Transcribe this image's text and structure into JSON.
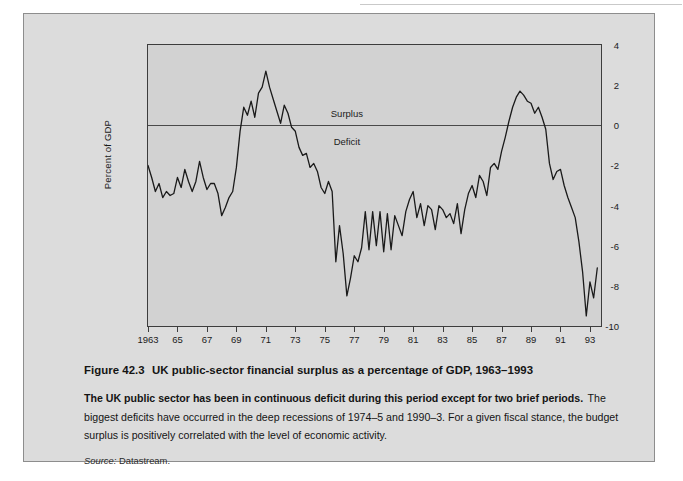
{
  "figure": {
    "number": "Figure 42.3",
    "title": "UK public-sector financial surplus as a percentage of GDP, 1963–1993",
    "lead": "The UK public sector has been in continuous deficit during this period except for two brief periods.",
    "body": "The biggest deficits have occurred in the deep recessions of 1974–5 and 1990–3. For a given fiscal stance, the budget surplus is positively correlated with the level of economic activity.",
    "source_label": "Source:",
    "source_value": "Datastream."
  },
  "colors": {
    "page_background": "#ffffff",
    "figure_background": "#dcdcdc",
    "plot_background": "#d2d2d2",
    "axis": "#3d3d3d",
    "line": "#1a1a1a",
    "text": "#141414"
  },
  "chart_data": {
    "type": "line",
    "title": "UK public-sector financial surplus as a percentage of GDP, 1963–1993",
    "xlabel": "",
    "ylabel": "Percent of GDP",
    "ylim": [
      -10,
      4
    ],
    "xlim": [
      1963,
      1993.75
    ],
    "yticks": [
      4,
      2,
      0,
      -2,
      -4,
      -6,
      -8,
      -10
    ],
    "ytick_labels": [
      "4",
      "2",
      "0",
      "-2",
      "-4",
      "-6",
      "-8",
      "-10"
    ],
    "xticks": [
      1963,
      1965,
      1967,
      1969,
      1971,
      1973,
      1975,
      1977,
      1979,
      1981,
      1983,
      1985,
      1987,
      1989,
      1991,
      1993
    ],
    "xtick_labels": [
      "1963",
      "65",
      "67",
      "69",
      "71",
      "73",
      "75",
      "77",
      "79",
      "81",
      "83",
      "85",
      "87",
      "89",
      "91",
      "93"
    ],
    "grid": false,
    "legend": "none",
    "annotations": [
      {
        "text": "Surplus",
        "x": 1976.5,
        "y": 0.55
      },
      {
        "text": "Deficit",
        "x": 1976.5,
        "y": -0.85
      }
    ],
    "reference_lines": [
      {
        "y": 0,
        "label": "zero"
      }
    ],
    "series": [
      {
        "name": "UK public-sector financial surplus (% of GDP)",
        "x": [
          1963.0,
          1963.25,
          1963.5,
          1963.75,
          1964.0,
          1964.25,
          1964.5,
          1964.75,
          1965.0,
          1965.25,
          1965.5,
          1965.75,
          1966.0,
          1966.25,
          1966.5,
          1966.75,
          1967.0,
          1967.25,
          1967.5,
          1967.75,
          1968.0,
          1968.25,
          1968.5,
          1968.75,
          1969.0,
          1969.25,
          1969.5,
          1969.75,
          1970.0,
          1970.25,
          1970.5,
          1970.75,
          1971.0,
          1971.25,
          1971.5,
          1971.75,
          1972.0,
          1972.25,
          1972.5,
          1972.75,
          1973.0,
          1973.25,
          1973.5,
          1973.75,
          1974.0,
          1974.25,
          1974.5,
          1974.75,
          1975.0,
          1975.25,
          1975.5,
          1975.75,
          1976.0,
          1976.25,
          1976.5,
          1976.75,
          1977.0,
          1977.25,
          1977.5,
          1977.75,
          1978.0,
          1978.25,
          1978.5,
          1978.75,
          1979.0,
          1979.25,
          1979.5,
          1979.75,
          1980.0,
          1980.25,
          1980.5,
          1980.75,
          1981.0,
          1981.25,
          1981.5,
          1981.75,
          1982.0,
          1982.25,
          1982.5,
          1982.75,
          1983.0,
          1983.25,
          1983.5,
          1983.75,
          1984.0,
          1984.25,
          1984.5,
          1984.75,
          1985.0,
          1985.25,
          1985.5,
          1985.75,
          1986.0,
          1986.25,
          1986.5,
          1986.75,
          1987.0,
          1987.25,
          1987.5,
          1987.75,
          1988.0,
          1988.25,
          1988.5,
          1988.75,
          1989.0,
          1989.25,
          1989.5,
          1989.75,
          1990.0,
          1990.25,
          1990.5,
          1990.75,
          1991.0,
          1991.25,
          1991.5,
          1991.75,
          1992.0,
          1992.25,
          1992.5,
          1992.75,
          1993.0,
          1993.25,
          1993.5
        ],
        "y": [
          -2.0,
          -2.6,
          -3.3,
          -2.9,
          -3.6,
          -3.3,
          -3.5,
          -3.4,
          -2.6,
          -3.1,
          -2.2,
          -2.8,
          -3.3,
          -2.8,
          -1.8,
          -2.6,
          -3.2,
          -2.9,
          -2.9,
          -3.4,
          -4.5,
          -4.1,
          -3.6,
          -3.3,
          -2.1,
          -0.3,
          0.9,
          0.5,
          1.2,
          0.4,
          1.6,
          1.9,
          2.7,
          1.9,
          1.3,
          0.7,
          0.1,
          1.0,
          0.6,
          -0.1,
          -0.3,
          -1.1,
          -1.5,
          -1.4,
          -2.1,
          -1.9,
          -2.3,
          -3.1,
          -3.4,
          -2.8,
          -3.3,
          -6.8,
          -5.0,
          -6.4,
          -8.5,
          -7.6,
          -6.5,
          -6.8,
          -6.1,
          -4.3,
          -6.2,
          -4.3,
          -6.0,
          -4.3,
          -6.3,
          -4.4,
          -6.2,
          -4.5,
          -5.0,
          -5.5,
          -4.3,
          -3.7,
          -3.3,
          -4.6,
          -3.9,
          -5.0,
          -4.0,
          -4.2,
          -5.2,
          -4.0,
          -4.2,
          -4.6,
          -4.4,
          -4.9,
          -3.9,
          -5.4,
          -4.2,
          -3.4,
          -3.0,
          -3.6,
          -2.5,
          -2.8,
          -3.5,
          -2.1,
          -1.9,
          -2.2,
          -1.3,
          -0.6,
          0.2,
          0.9,
          1.4,
          1.7,
          1.5,
          1.2,
          1.1,
          0.6,
          0.9,
          0.4,
          -0.2,
          -1.9,
          -2.7,
          -2.3,
          -2.2,
          -3.0,
          -3.6,
          -4.1,
          -4.6,
          -5.8,
          -7.3,
          -9.5,
          -7.8,
          -8.6,
          -7.1
        ]
      }
    ]
  }
}
